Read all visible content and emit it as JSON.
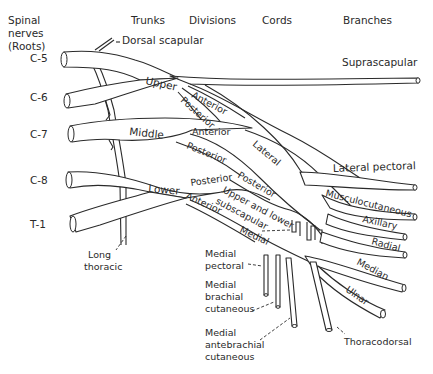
{
  "headers": {
    "roots_line1": "Spinal",
    "roots_line2": "nerves",
    "roots_line3": "(Roots)",
    "trunks": "Trunks",
    "divisions": "Divisions",
    "cords": "Cords",
    "branches": "Branches"
  },
  "roots": [
    "C-5",
    "C-6",
    "C-7",
    "C-8",
    "T-1"
  ],
  "trunks": {
    "upper": "Upper",
    "middle": "Middle",
    "lower": "Lower"
  },
  "divisions": {
    "upper_anterior": "Anterior",
    "upper_posterior": "Posterior",
    "middle_anterior": "Anterior",
    "middle_posterior": "Posterior",
    "lower_posterior": "Posterior",
    "lower_anterior": "Anterior"
  },
  "cords": {
    "lateral": "Lateral",
    "posterior": "Posterior",
    "medial": "Medial"
  },
  "branches": {
    "dorsal_scapular": "Dorsal scapular",
    "suprascapular": "Suprascapular",
    "lateral_pectoral": "Lateral pectoral",
    "musculocutaneous": "Musculocutaneous",
    "axillary": "Axillary",
    "radial": "Radial",
    "median": "Median",
    "ulnar": "Ulnar",
    "thoracodorsal": "Thoracodorsal",
    "subscapular_line1": "Upper and lower",
    "subscapular_line2": "subscapular",
    "long_thoracic_line1": "Long",
    "long_thoracic_line2": "thoracic",
    "medial_pectoral_line1": "Medial",
    "medial_pectoral_line2": "pectoral",
    "medial_brachial_line1": "Medial",
    "medial_brachial_line2": "brachial",
    "medial_brachial_line3": "cutaneous",
    "medial_antebrachial_line1": "Medial",
    "medial_antebrachial_line2": "antebrachial",
    "medial_antebrachial_line3": "cutaneous"
  }
}
